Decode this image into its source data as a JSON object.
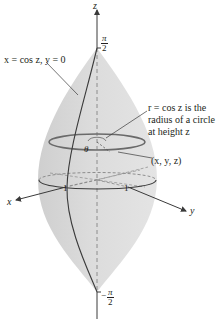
{
  "figure": {
    "type": "3D surface of revolution",
    "axes": {
      "z_label": "z",
      "x_label": "x",
      "y_label": "y",
      "x_tick": "1",
      "y_tick": "1",
      "z_top_tick": {
        "num": "π",
        "den": "2",
        "sign": ""
      },
      "z_bottom_tick": {
        "num": "π",
        "den": "2",
        "sign": "−"
      }
    },
    "annotations": {
      "curve_label": "x = cos z, y = 0",
      "radius_line1": "r = cos z is the",
      "radius_line2": "radius of a circle",
      "radius_line3": "at height z",
      "angle": "θ",
      "point": "(x, y, z)"
    },
    "colors": {
      "surface_fill": "#d4d4d4",
      "surface_light": "#e6e6e6",
      "stroke": "#3a3a3a",
      "text": "#231f20"
    }
  }
}
